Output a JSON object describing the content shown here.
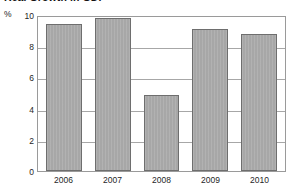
{
  "chart_data": {
    "type": "bar",
    "title": "Real Growth in GDP",
    "xlabel": "",
    "ylabel": "%",
    "categories": [
      "2006",
      "2007",
      "2008",
      "2009",
      "2010"
    ],
    "values": [
      9.4,
      9.8,
      4.9,
      9.1,
      8.8
    ],
    "ylim": [
      0,
      10
    ],
    "yticks": [
      0,
      2,
      4,
      6,
      8,
      10
    ],
    "ytick_labels": [
      "0",
      "2",
      "4",
      "6",
      "8",
      "10"
    ],
    "grid": true,
    "grid_axis": "y",
    "legend": false,
    "legend_position": "none",
    "bar_color": "#a9a9a9",
    "bar_edge_color": "#6e6e6e",
    "frame_color": "#9a9a9a",
    "gridline_color": "#a7a7a7",
    "background": "#ffffff"
  },
  "axis": {
    "unit_label": "%"
  }
}
